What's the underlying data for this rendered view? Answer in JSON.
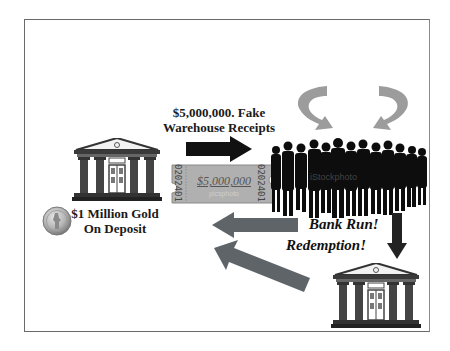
{
  "diagram": {
    "type": "flow-illustration",
    "topic": "fractional reserve / bank run",
    "labels": {
      "receipts_line1": "$5,000,000. Fake",
      "receipts_line2": "Warehouse Receipts",
      "gold_line1": "$1 Million Gold",
      "gold_line2": "On Deposit",
      "bank_run": "Bank Run!",
      "redemption": "Redemption!"
    },
    "ticket": {
      "amount": "$5,000,000",
      "serial": "0202401",
      "watermark": "picsphoto"
    },
    "crowd": {
      "watermark": "iStockphoto"
    },
    "nodes": [
      {
        "id": "bank-left",
        "kind": "bank-building-icon"
      },
      {
        "id": "gold-coin",
        "kind": "gold-coin-icon"
      },
      {
        "id": "crowd",
        "kind": "crowd-silhouette"
      },
      {
        "id": "bank-bottom-right",
        "kind": "bank-building-icon"
      }
    ],
    "edges": [
      {
        "from": "bank-left",
        "to": "crowd",
        "label": "$5,000,000. Fake Warehouse Receipts",
        "style": "black-arrow"
      },
      {
        "from": "crowd",
        "to": "bank-left",
        "label": "Bank Run!",
        "style": "gray-arrow"
      },
      {
        "from": "bank-bottom-right",
        "to": "bank-left",
        "label": "Redemption!",
        "style": "gray-arrow"
      },
      {
        "from": "crowd",
        "to": "bank-bottom-right",
        "style": "black-arrow-down"
      },
      {
        "from": "crowd",
        "to": "crowd",
        "style": "circular-arrows"
      }
    ],
    "colors": {
      "frame": "#6a6a6a",
      "black_arrow": "#111111",
      "gray_arrow": "#5e6468",
      "circle_arrow": "#9a9a9a",
      "ticket": "#a9a9a9",
      "coin": "#b9b9b9"
    }
  }
}
